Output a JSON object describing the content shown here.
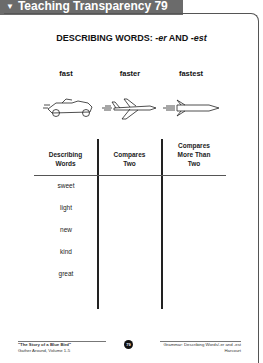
{
  "header": {
    "marker": "▼",
    "label": "Teaching Transparency 79"
  },
  "title": {
    "prefix": "DESCRIBING WORDS: ",
    "suffix1": "-er",
    "and": " AND ",
    "suffix2": "-est"
  },
  "examples": [
    {
      "word": "fast",
      "icon": "race-car-icon"
    },
    {
      "word": "faster",
      "icon": "airplane-icon"
    },
    {
      "word": "fastest",
      "icon": "rocket-icon"
    }
  ],
  "table": {
    "headers": [
      {
        "line1": "Describing",
        "line2": "Words"
      },
      {
        "line1": "Compares",
        "line2": "Two"
      },
      {
        "line1": "Compares",
        "line2": "More Than",
        "line3": "Two"
      }
    ],
    "rows": [
      "sweet",
      "light",
      "new",
      "kind",
      "great"
    ]
  },
  "footer": {
    "left_line1": "\"The Story of a Blue Bird\"",
    "left_line2": "Gather Around, Volume 1-5",
    "page_number": "79",
    "right_line1": "Grammar: Describing Words/-er and -est",
    "right_line2": "Harcourt"
  }
}
